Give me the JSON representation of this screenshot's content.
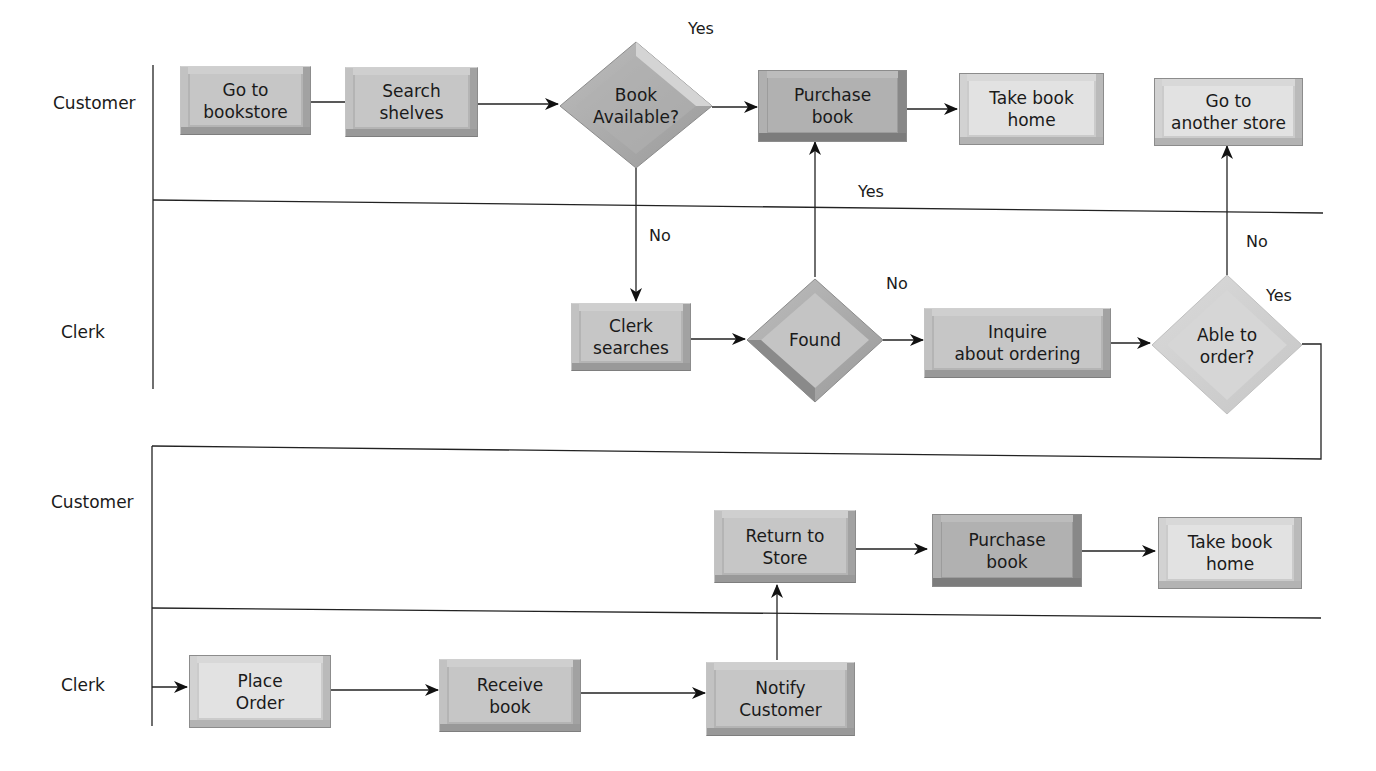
{
  "diagram": {
    "type": "swimlane-flowchart",
    "lanes": [
      {
        "id": "lane1",
        "label": "Customer"
      },
      {
        "id": "lane2",
        "label": "Clerk"
      },
      {
        "id": "lane3",
        "label": "Customer"
      },
      {
        "id": "lane4",
        "label": "Clerk"
      }
    ],
    "nodes": {
      "go_to_bookstore": {
        "label": "Go to\nbookstore",
        "shape": "rect",
        "lane": "Customer"
      },
      "search_shelves": {
        "label": "Search\nshelves",
        "shape": "rect",
        "lane": "Customer"
      },
      "book_available": {
        "label": "Book\nAvailable?",
        "shape": "diamond",
        "lane": "Customer"
      },
      "purchase_book_1": {
        "label": "Purchase\nbook",
        "shape": "rect",
        "lane": "Customer"
      },
      "take_book_home_1": {
        "label": "Take book\nhome",
        "shape": "rect",
        "lane": "Customer"
      },
      "go_to_another_store": {
        "label": "Go to\nanother store",
        "shape": "rect",
        "lane": "Customer"
      },
      "clerk_searches": {
        "label": "Clerk\nsearches",
        "shape": "rect",
        "lane": "Clerk"
      },
      "found": {
        "label": "Found",
        "shape": "diamond",
        "lane": "Clerk"
      },
      "inquire_ordering": {
        "label": "Inquire\nabout ordering",
        "shape": "rect",
        "lane": "Clerk"
      },
      "able_to_order": {
        "label": "Able to\norder?",
        "shape": "diamond",
        "lane": "Clerk"
      },
      "return_to_store": {
        "label": "Return to\nStore",
        "shape": "rect",
        "lane": "Customer"
      },
      "purchase_book_2": {
        "label": "Purchase\nbook",
        "shape": "rect",
        "lane": "Customer"
      },
      "take_book_home_2": {
        "label": "Take book\nhome",
        "shape": "rect",
        "lane": "Customer"
      },
      "place_order": {
        "label": "Place\nOrder",
        "shape": "rect",
        "lane": "Clerk"
      },
      "receive_book": {
        "label": "Receive\nbook",
        "shape": "rect",
        "lane": "Clerk"
      },
      "notify_customer": {
        "label": "Notify\nCustomer",
        "shape": "rect",
        "lane": "Clerk"
      }
    },
    "edge_labels": {
      "book_available_yes": "Yes",
      "book_available_no": "No",
      "found_yes": "Yes",
      "found_no": "No",
      "able_to_order_no": "No",
      "able_to_order_yes": "Yes"
    },
    "edges": [
      {
        "from": "go_to_bookstore",
        "to": "search_shelves"
      },
      {
        "from": "search_shelves",
        "to": "book_available"
      },
      {
        "from": "book_available",
        "to": "purchase_book_1",
        "label": "Yes"
      },
      {
        "from": "book_available",
        "to": "clerk_searches",
        "label": "No"
      },
      {
        "from": "purchase_book_1",
        "to": "take_book_home_1"
      },
      {
        "from": "clerk_searches",
        "to": "found"
      },
      {
        "from": "found",
        "to": "purchase_book_1",
        "label": "Yes"
      },
      {
        "from": "found",
        "to": "inquire_ordering",
        "label": "No"
      },
      {
        "from": "inquire_ordering",
        "to": "able_to_order"
      },
      {
        "from": "able_to_order",
        "to": "go_to_another_store",
        "label": "No"
      },
      {
        "from": "able_to_order",
        "to": "place_order",
        "label": "Yes"
      },
      {
        "from": "place_order",
        "to": "receive_book"
      },
      {
        "from": "receive_book",
        "to": "notify_customer"
      },
      {
        "from": "notify_customer",
        "to": "return_to_store"
      },
      {
        "from": "return_to_store",
        "to": "purchase_book_2"
      },
      {
        "from": "purchase_book_2",
        "to": "take_book_home_2"
      }
    ],
    "colors": {
      "line": "#1a1a1a",
      "box_medium": "#b4b4b4",
      "box_dark": "#9c9c9c",
      "box_light": "#d6d6d6",
      "diamond_medium": "#a9a9a9",
      "diamond_light": "#d2d2d2"
    }
  }
}
